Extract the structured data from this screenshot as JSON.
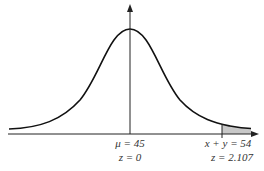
{
  "diagram": {
    "type": "normal-distribution-curve",
    "mean_label": "μ = 45",
    "mean_z_label": "z = 0",
    "cutoff_label": "x + y = 54",
    "cutoff_z_label": "z = 2.107",
    "shaded_region": "right tail beyond x + y = 54",
    "colors": {
      "curve": "#111111",
      "axis": "#222222",
      "shade": "#c8c8c8"
    }
  }
}
